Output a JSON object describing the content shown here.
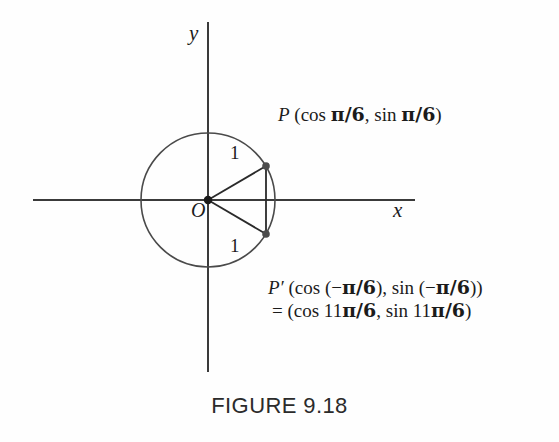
{
  "figure": {
    "caption": "FIGURE 9.18",
    "axes": {
      "y_label": "y",
      "x_label": "x",
      "origin_label": "O"
    },
    "labels": {
      "radius_upper": "1",
      "radius_lower": "1",
      "point_p": {
        "name": "P",
        "text": "P (cos π/6, sin π/6)",
        "prefix": "P",
        "open": " (cos ",
        "angle1": "π/6",
        "mid": ", sin ",
        "angle2": "π/6",
        "close": ")"
      },
      "point_p_prime": {
        "name": "P′",
        "line1": "P′ (cos (−π/6), sin (−π/6))",
        "line2": "= (cos 11π/6, sin 11π/6)",
        "prefix": "P′",
        "line1_open": " (cos (−",
        "line1_angle1": "π/6",
        "line1_mid": "), sin (−",
        "line1_angle2": "π/6",
        "line1_close": "))",
        "line2_open": "= (cos 11",
        "line2_angle1": "π/6",
        "line2_mid": ", sin 11",
        "line2_angle2": "π/6",
        "line2_close": ")"
      }
    },
    "colors": {
      "ink": "#1b1b1b",
      "stroke": "#3a3a3a",
      "background": "#fefefe",
      "caption": "#2b2b2b"
    },
    "geometry": {
      "center": [
        208,
        200
      ],
      "radius_px": 67,
      "unit_radius": 1,
      "point_p_angle_deg": 30,
      "point_p_prime_angle_deg": -30,
      "point_p_px": [
        266,
        166
      ],
      "point_p_prime_px": [
        266,
        234
      ],
      "x_axis_span": [
        33,
        415
      ],
      "y_axis_span": [
        22,
        372
      ]
    }
  }
}
